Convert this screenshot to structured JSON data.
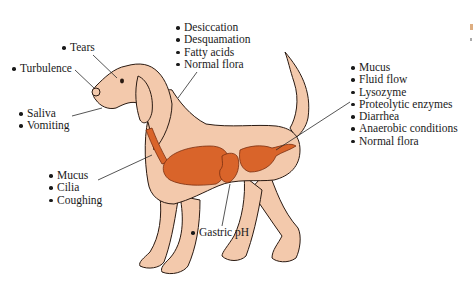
{
  "figure": {
    "type": "anatomical-diagram",
    "colors": {
      "skin": "#f3c9ac",
      "organs": "#d9642a",
      "outline": "#2a1a12",
      "leader_line": "#2a2a2a"
    }
  },
  "labels": {
    "tears": {
      "items": [
        "Tears"
      ]
    },
    "turbulence": {
      "items": [
        "Turbulence"
      ]
    },
    "saliva": {
      "items": [
        "Saliva",
        "Vomiting"
      ]
    },
    "skin": {
      "items": [
        "Desiccation",
        "Desquamation",
        "Fatty acids",
        "Normal flora"
      ]
    },
    "intestine": {
      "items": [
        "Mucus",
        "Fluid flow",
        "Lysozyme",
        "Proteolytic enzymes",
        "Diarrhea",
        "Anaerobic conditions",
        "Normal flora"
      ]
    },
    "respiratory": {
      "items": [
        "Mucus",
        "Cilia",
        "Coughing"
      ]
    },
    "stomach": {
      "items": [
        "Gastric pH"
      ]
    }
  }
}
